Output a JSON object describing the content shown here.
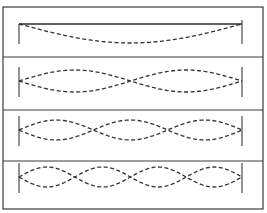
{
  "figure": {
    "title": "",
    "colors": {
      "ink": "#333333",
      "background": "#ffffff"
    },
    "frame": {
      "x": 3,
      "y": 7,
      "width": 260,
      "height": 202
    },
    "string": {
      "x_start": 19,
      "x_end": 242
    },
    "panels": [
      {
        "name": "mode-1",
        "harmonic": 1,
        "loops": 1,
        "top": 7,
        "bottom": 57,
        "center_y": 33,
        "amplitude": 10,
        "rest_line": true,
        "rest_line_y": 24,
        "single_curve": true
      },
      {
        "name": "mode-2",
        "harmonic": 2,
        "loops": 2,
        "top": 57,
        "bottom": 110,
        "center_y": 81,
        "amplitude": 11,
        "rest_line": false
      },
      {
        "name": "mode-3",
        "harmonic": 3,
        "loops": 3,
        "top": 110,
        "bottom": 161,
        "center_y": 130,
        "amplitude": 10,
        "rest_line": false
      },
      {
        "name": "mode-4",
        "harmonic": 4,
        "loops": 4,
        "top": 161,
        "bottom": 209,
        "center_y": 177,
        "amplitude": 10,
        "rest_line": false
      }
    ]
  }
}
